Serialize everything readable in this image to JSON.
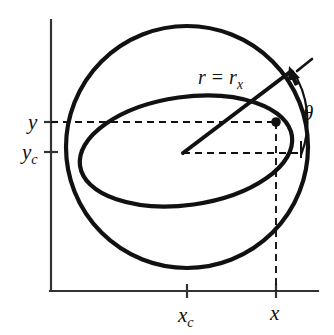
{
  "figure": {
    "kind": "geometry-diagram",
    "background_color": "#ffffff",
    "stroke_color": "#111111",
    "axis_color": "#333333"
  },
  "axes": {
    "y_axis": {
      "name": "y-axis",
      "x": 51,
      "y_top": 20,
      "y_bottom": 291
    },
    "x_axis": {
      "name": "x-axis",
      "y": 291,
      "x_left": 51,
      "x_right": 318
    }
  },
  "labels": {
    "radius": {
      "text": "r = r",
      "base": "r",
      "operator": "=",
      "second_base": "r",
      "subscript": "x",
      "full": "r = r_x",
      "x": 198,
      "y": 84
    },
    "theta": {
      "text": "θ",
      "full": "θ",
      "x": 305,
      "y": 116
    },
    "y_value": {
      "text": "y",
      "full": "y",
      "x": 31,
      "y": 128
    },
    "y_center": {
      "base": "y",
      "subscript": "c",
      "full": "y_c",
      "x": 25,
      "y": 158
    },
    "x_center": {
      "base": "x",
      "subscript": "c",
      "full": "x_c",
      "x": 180,
      "y": 320
    },
    "x_value": {
      "text": "x",
      "full": "x",
      "x": 272,
      "y": 318
    }
  },
  "ticks": {
    "y_ticks": [
      {
        "name": "tick-y",
        "value": "y",
        "y": 122
      },
      {
        "name": "tick-yc",
        "value": "y_c",
        "y": 152
      }
    ],
    "x_ticks": [
      {
        "name": "tick-xc",
        "value": "x_c",
        "x": 187
      },
      {
        "name": "tick-x",
        "value": "x",
        "x": 276
      }
    ]
  },
  "geometry": {
    "sphere": {
      "name": "sphere-outline",
      "center_x": 187,
      "center_y": 147,
      "radius": 121
    },
    "equator_ellipse": {
      "name": "equator-ellipse",
      "center_x": 186,
      "center_y": 151,
      "radius_x": 107,
      "radius_y": 54,
      "rotation_deg": -8
    },
    "center_point": {
      "name": "sphere-center",
      "x": 183,
      "y": 153
    },
    "marked_point": {
      "name": "surface-point",
      "x": 276,
      "y": 122,
      "dot_radius": 4.5
    },
    "radius_line": {
      "name": "radius-line",
      "x1": 183,
      "y1": 153,
      "x2": 289,
      "y2": 73
    },
    "tangent_dash": {
      "name": "tangent-ray",
      "x1": 296,
      "y1": 72,
      "x2": 312,
      "y2": 60
    },
    "theta_arc": {
      "name": "theta-arc",
      "start_x": 291,
      "start_y": 69,
      "end_x": 301,
      "end_y": 155,
      "sweep_radius": 90
    },
    "theta_baseline": {
      "name": "theta-baseline-tick",
      "x": 301,
      "y_top": 142,
      "y_bottom": 158
    },
    "dashed_lines": [
      {
        "name": "dashed-y-to-point",
        "x1": 51,
        "y1": 122,
        "x2": 276,
        "y2": 122
      },
      {
        "name": "dashed-center-horizontal",
        "x1": 183,
        "y1": 153,
        "x2": 300,
        "y2": 153
      },
      {
        "name": "dashed-point-to-x",
        "x1": 276,
        "y1": 122,
        "x2": 276,
        "y2": 291
      }
    ]
  }
}
